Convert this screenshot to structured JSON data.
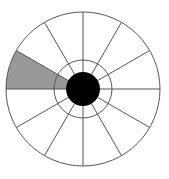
{
  "figure": {
    "background_color": "#ffffff",
    "canvas": {
      "width": 169,
      "height": 179
    }
  },
  "chart_data": {
    "type": "pie",
    "subtitle": "",
    "xlabel": "",
    "ylabel": "",
    "legend_position": "none",
    "grid": false,
    "center": {
      "x": 83,
      "y": 89
    },
    "outer_radius": 77,
    "inner_ring_radius": 29,
    "hub_radius": 17,
    "sector_count": 12,
    "sector_angle_degrees": 30,
    "categories": [
      "S1",
      "S2",
      "S3",
      "S4",
      "S5",
      "S6",
      "S7",
      "S8",
      "S9",
      "S10",
      "S11",
      "S12"
    ],
    "values": [
      30,
      30,
      30,
      30,
      30,
      30,
      30,
      30,
      30,
      30,
      30,
      30
    ],
    "highlighted_indices": [
      5
    ],
    "sectors": [
      {
        "label": "S1",
        "start_deg": 0,
        "end_deg": 30,
        "filled": false,
        "color": "#ffffff"
      },
      {
        "label": "S2",
        "start_deg": 30,
        "end_deg": 60,
        "filled": false,
        "color": "#ffffff"
      },
      {
        "label": "S3",
        "start_deg": 60,
        "end_deg": 90,
        "filled": false,
        "color": "#ffffff"
      },
      {
        "label": "S4",
        "start_deg": 90,
        "end_deg": 120,
        "filled": false,
        "color": "#ffffff"
      },
      {
        "label": "S5",
        "start_deg": 120,
        "end_deg": 150,
        "filled": false,
        "color": "#ffffff"
      },
      {
        "label": "S6",
        "start_deg": 150,
        "end_deg": 180,
        "filled": true,
        "color": "#999999"
      },
      {
        "label": "S7",
        "start_deg": 180,
        "end_deg": 210,
        "filled": false,
        "color": "#ffffff"
      },
      {
        "label": "S8",
        "start_deg": 210,
        "end_deg": 240,
        "filled": false,
        "color": "#ffffff"
      },
      {
        "label": "S9",
        "start_deg": 240,
        "end_deg": 270,
        "filled": false,
        "color": "#ffffff"
      },
      {
        "label": "S10",
        "start_deg": 270,
        "end_deg": 300,
        "filled": false,
        "color": "#ffffff"
      },
      {
        "label": "S11",
        "start_deg": 300,
        "end_deg": 330,
        "filled": false,
        "color": "#ffffff"
      },
      {
        "label": "S12",
        "start_deg": 330,
        "end_deg": 360,
        "filled": false,
        "color": "#ffffff"
      }
    ],
    "colors": {
      "stroke": "#555555",
      "sector_blank": "#ffffff",
      "sector_highlight": "#999999",
      "hub": "#000000",
      "background": "#ffffff"
    }
  }
}
